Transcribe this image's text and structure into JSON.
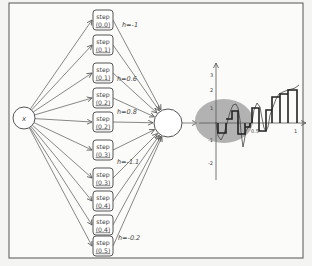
{
  "figure": {
    "input_node": {
      "label": "x"
    },
    "step_nodes": [
      {
        "line1": "step",
        "line2": "(0.0)",
        "cy": 20
      },
      {
        "line1": "step",
        "line2": "(0.1)",
        "cy": 45
      },
      {
        "line1": "step",
        "line2": "(0.1)",
        "cy": 73
      },
      {
        "line1": "step",
        "line2": "(0.2)",
        "cy": 98
      },
      {
        "line1": "step",
        "line2": "(0.2)",
        "cy": 122
      },
      {
        "line1": "step",
        "line2": "(0.3)",
        "cy": 150
      },
      {
        "line1": "step",
        "line2": "(0.3)",
        "cy": 178
      },
      {
        "line1": "step",
        "line2": "(0.4)",
        "cy": 201
      },
      {
        "line1": "step",
        "line2": "(0.4)",
        "cy": 225
      },
      {
        "line1": "step",
        "line2": "(0.5)",
        "cy": 246
      }
    ],
    "weight_labels": [
      {
        "text": "h=-1",
        "x": 122,
        "y": 27
      },
      {
        "text": "h=0.6",
        "x": 117,
        "y": 81
      },
      {
        "text": "h=0.8",
        "x": 117,
        "y": 114
      },
      {
        "text": "h=-1.1",
        "x": 117,
        "y": 164
      },
      {
        "text": "h=-0.2",
        "x": 118,
        "y": 240
      }
    ],
    "sum_node": {
      "label": ""
    },
    "graph": {
      "y_ticks": [
        "3",
        "2",
        "1",
        "-1",
        "-2"
      ],
      "x_ticks": [
        "0.5",
        "1"
      ]
    }
  }
}
